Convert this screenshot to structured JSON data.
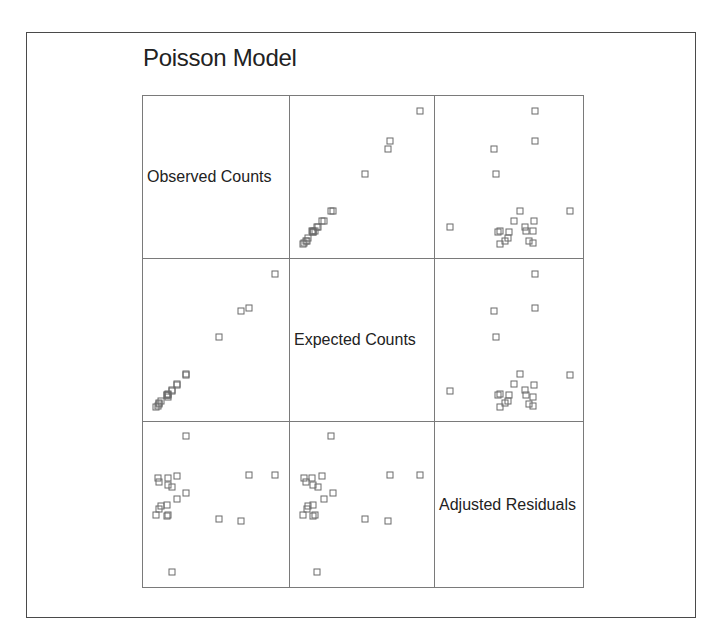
{
  "title": "Poisson Model",
  "variables": [
    "Observed Counts",
    "Expected Counts",
    "Adjusted Residuals"
  ],
  "colors": {
    "frame": "#4a4a4a",
    "grid": "#7a7a7a",
    "marker": "#6a6a6a",
    "text": "#222222"
  },
  "chart_data": {
    "type": "scatter",
    "subtype": "scatterplot-matrix",
    "title": "Poisson Model",
    "variables": [
      "Observed Counts",
      "Expected Counts",
      "Adjusted Residuals"
    ],
    "marker": "open-square",
    "axes_ticks": "none",
    "note": "Values normalized 0-1 within each variable's plotting range (no axis ticks shown)",
    "observations": [
      {
        "observed": 0.27,
        "expected": 0.26,
        "residual": 0.96
      },
      {
        "observed": 0.05,
        "expected": 0.05,
        "residual": 0.68
      },
      {
        "observed": 0.13,
        "expected": 0.11,
        "residual": 0.68
      },
      {
        "observed": 0.2,
        "expected": 0.19,
        "residual": 0.69
      },
      {
        "observed": 0.75,
        "expected": 0.72,
        "residual": 0.7
      },
      {
        "observed": 0.95,
        "expected": 0.95,
        "residual": 0.7
      },
      {
        "observed": 0.06,
        "expected": 0.06,
        "residual": 0.65
      },
      {
        "observed": 0.13,
        "expected": 0.12,
        "residual": 0.63
      },
      {
        "observed": 0.16,
        "expected": 0.16,
        "residual": 0.62
      },
      {
        "observed": 0.27,
        "expected": 0.27,
        "residual": 0.58
      },
      {
        "observed": 0.2,
        "expected": 0.2,
        "residual": 0.54
      },
      {
        "observed": 0.08,
        "expected": 0.08,
        "residual": 0.49
      },
      {
        "observed": 0.12,
        "expected": 0.12,
        "residual": 0.5
      },
      {
        "observed": 0.06,
        "expected": 0.07,
        "residual": 0.47
      },
      {
        "observed": 0.04,
        "expected": 0.04,
        "residual": 0.43
      },
      {
        "observed": 0.13,
        "expected": 0.13,
        "residual": 0.43
      },
      {
        "observed": 0.12,
        "expected": 0.12,
        "residual": 0.42
      },
      {
        "observed": 0.52,
        "expected": 0.52,
        "residual": 0.4
      },
      {
        "observed": 0.69,
        "expected": 0.7,
        "residual": 0.39
      },
      {
        "observed": 0.16,
        "expected": 0.15,
        "residual": 0.05
      }
    ],
    "panels": [
      {
        "row": 0,
        "col": 0,
        "kind": "label",
        "text": "Observed Counts"
      },
      {
        "row": 0,
        "col": 1,
        "kind": "scatter",
        "x": "expected",
        "y": "observed"
      },
      {
        "row": 0,
        "col": 2,
        "kind": "scatter",
        "x": "residual",
        "y": "observed"
      },
      {
        "row": 1,
        "col": 0,
        "kind": "scatter",
        "x": "observed",
        "y": "expected"
      },
      {
        "row": 1,
        "col": 1,
        "kind": "label",
        "text": "Expected Counts"
      },
      {
        "row": 1,
        "col": 2,
        "kind": "scatter",
        "x": "residual",
        "y": "expected"
      },
      {
        "row": 2,
        "col": 0,
        "kind": "scatter",
        "x": "observed",
        "y": "residual"
      },
      {
        "row": 2,
        "col": 1,
        "kind": "scatter",
        "x": "expected",
        "y": "residual"
      },
      {
        "row": 2,
        "col": 2,
        "kind": "label",
        "text": "Adjusted Residuals"
      }
    ]
  }
}
